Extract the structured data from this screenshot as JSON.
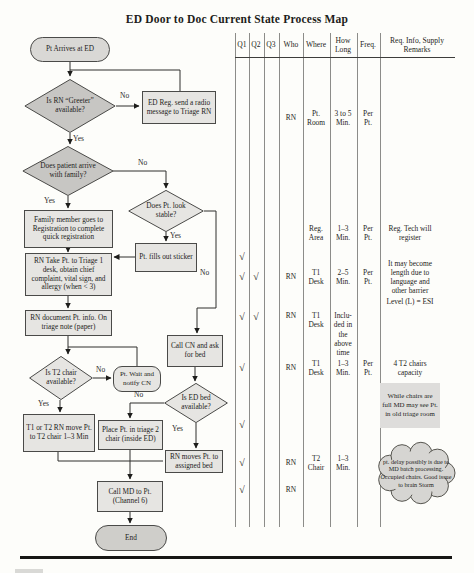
{
  "title": "ED Door to Doc Current State Process Map",
  "colors": {
    "node_fill": "#e6e5e2",
    "node_fill_dark": "#c7c6c3",
    "start_fill": "#d9d8d5",
    "end_fill": "#cfceca",
    "border": "#4a4a48",
    "line": "#2e2e2c",
    "note_bg": "#dedddb",
    "cloud_fill": "#d6d5d2"
  },
  "flowchart": {
    "start": "Pt Arrives at ED",
    "greeter": "Is RN “Greeter” available?",
    "ed_reg": "ED Reg. send a radio message to Triage RN",
    "family": "Does patient arrive with family?",
    "family_reg": "Family member goes to Registration to complete quick registration",
    "stable": "Does Pt. look stable?",
    "sticker": "Pt. fills out sticker",
    "rn_take": "RN Take Pt. to Triage 1 desk, obtain chief complaint, vital sign, and allergy (when < 3)",
    "rn_document": "RN document Pt. info. On triage note (paper)",
    "t2_chair": "Is T2 chair available?",
    "pt_wait": "Pt. Wait and notify CN",
    "t1_t2_move": "T1 or T2 RN move Pt. to T2 chair 1–3 Min",
    "call_cn": "Call CN and ask for bed",
    "ed_bed": "Is ED bed available?",
    "place_pt": "Place Pt. in triage 2 chair (inside ED)",
    "rn_moves": "RN moves Pt. to assigned bed",
    "call_md": "Call MD to Pt. (Channel 6)",
    "end": "End",
    "labels": {
      "yes": "Yes",
      "no": "No"
    }
  },
  "table": {
    "headers": [
      "Q1",
      "Q2",
      "Q3",
      "Who",
      "Where",
      "How Long",
      "Freq.",
      "Req. Info, Supply Remarks"
    ],
    "rows": [
      {
        "who": "RN",
        "where": "Pt. Room",
        "how_long": "3 to 5 Min.",
        "freq": "Per Pt."
      },
      {
        "where": "Reg. Area",
        "how_long": "1–3 Min.",
        "freq": "Per Pt.",
        "remarks": "Reg. Tech will register"
      },
      {
        "q1": "√"
      },
      {
        "q1": "√",
        "q2": "√",
        "who": "RN",
        "where": "T1 Desk",
        "how_long": "2–5 Min.",
        "freq": "Per Pt.",
        "remarks": "It may become length due to language and other barrier"
      },
      {
        "remarks": "Level (L) = ESI"
      },
      {
        "q1": "√",
        "q2": "√",
        "who": "RN",
        "where": "T1 Desk",
        "how_long": "Inclu- ded in the above time"
      },
      {
        "q1": "√",
        "who": "RN",
        "where": "T1 Desk",
        "how_long": "1–3 Min.",
        "freq": "Per Pt.",
        "remarks": "4 T2 chairs capacity"
      },
      {
        "q1": "√"
      },
      {
        "q1": "√",
        "who": "RN",
        "where": "T2 Chair",
        "how_long": "1–3 Min."
      },
      {
        "q1": "√",
        "who": "RN"
      }
    ],
    "notes": {
      "chairs_full": "While chairs are full MD may see Pt. in old triage room",
      "cloud": "pt. delay possibly is due to MD batch processing. Occupied chairs. Good issue to brain Storm"
    }
  }
}
